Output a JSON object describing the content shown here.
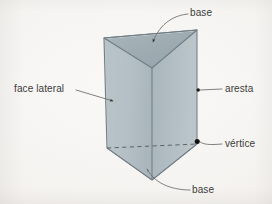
{
  "figure": {
    "kind": "geometry-diagram",
    "shape_name": "triangular prism",
    "language": "pt",
    "background_color": "#f5f3f0",
    "faces": {
      "top_base_color": "#9fadb3",
      "left_lateral_color": "#b6c2c6",
      "right_lateral_color": "#b2bdc3",
      "bottom_base_color": "#bcc6c9",
      "outline_color": "#6f7d84"
    },
    "leader_color": "#6a6a6a",
    "vertex_dot_color": "#1a1a1a"
  },
  "labels": {
    "base_top": "base",
    "face_lateral": "face lateral",
    "aresta": "aresta",
    "vertice": "vértice",
    "base_bottom": "base"
  },
  "annotations": [
    {
      "label": "base",
      "position": "top-right",
      "points_to": "top base face",
      "marker": "arrowhead",
      "leader": "curved"
    },
    {
      "label": "face lateral",
      "position": "middle-left",
      "points_to": "left lateral face",
      "marker": "arrowhead",
      "leader": "straight"
    },
    {
      "label": "aresta",
      "position": "middle-right",
      "points_to": "right vertical edge",
      "marker": "dot",
      "leader": "straight"
    },
    {
      "label": "vértice",
      "position": "lower-right",
      "points_to": "bottom right vertex",
      "marker": "dot",
      "leader": "curved"
    },
    {
      "label": "base",
      "position": "bottom-right",
      "points_to": "bottom base face",
      "marker": "arrowhead",
      "leader": "curved"
    }
  ],
  "geometry": {
    "top_face_vertices": [
      [
        104,
        38
      ],
      [
        197,
        30
      ],
      [
        152,
        68
      ]
    ],
    "bottom_face_vertices": [
      [
        107,
        148
      ],
      [
        197,
        144
      ],
      [
        152,
        180
      ]
    ],
    "hidden_edge": [
      [
        107,
        148
      ],
      [
        197,
        144
      ]
    ],
    "vertical_edges": [
      [
        [
          104,
          38
        ],
        [
          107,
          148
        ]
      ],
      [
        [
          197,
          30
        ],
        [
          197,
          144
        ]
      ],
      [
        [
          152,
          68
        ],
        [
          152,
          180
        ]
      ]
    ]
  }
}
